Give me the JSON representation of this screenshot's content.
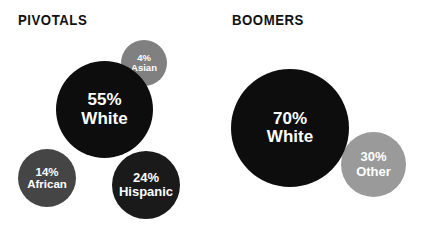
{
  "chart_data": {
    "type": "bubble",
    "title": "",
    "xlabel": "",
    "ylabel": "",
    "legend_position": "none",
    "grid": false,
    "units": "percent",
    "background_color": "#ffffff",
    "groups": [
      {
        "name": "PIVOTALS",
        "categories": [
          "White",
          "Hispanic",
          "African",
          "Asian"
        ],
        "values": [
          55,
          24,
          14,
          4
        ],
        "bubbles": [
          {
            "percent": "55%",
            "group": "White",
            "value": 55,
            "color": "#0d0d0d"
          },
          {
            "percent": "24%",
            "group": "Hispanic",
            "value": 24,
            "color": "#1a1a1a"
          },
          {
            "percent": "14%",
            "group": "African",
            "value": 14,
            "color": "#454545"
          },
          {
            "percent": "4%",
            "group": "Asian",
            "value": 4,
            "color": "#808080"
          }
        ]
      },
      {
        "name": "BOOMERS",
        "categories": [
          "White",
          "Other"
        ],
        "values": [
          70,
          30
        ],
        "bubbles": [
          {
            "percent": "70%",
            "group": "White",
            "value": 70,
            "color": "#0d0d0d"
          },
          {
            "percent": "30%",
            "group": "Other",
            "value": 30,
            "color": "#9a9a9a"
          }
        ]
      }
    ]
  },
  "colors": {
    "background": "#ffffff",
    "title_text": "#111111",
    "bubble_label_text": "#ffffff",
    "black_bubble": "#0d0d0d",
    "near_black_bubble": "#1a1a1a",
    "dark_gray_bubble": "#454545",
    "medium_gray_bubble": "#808080",
    "light_gray_bubble": "#9a9a9a"
  }
}
